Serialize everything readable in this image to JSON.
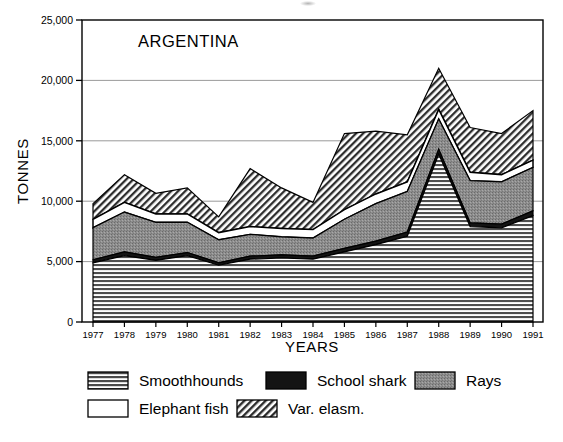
{
  "figure": {
    "panel_title": "ARGENTINA",
    "x_axis_title": "YEARS",
    "y_axis_title": "TONNES"
  },
  "legend": {
    "entries": [
      {
        "label": "Smoothhounds",
        "pattern": "horizontal-lines",
        "color": "#555555"
      },
      {
        "label": "School shark",
        "pattern": "solid-black",
        "color": "#141414"
      },
      {
        "label": "Rays",
        "pattern": "gray-stipple",
        "color": "#8a8a8a"
      },
      {
        "label": "Elephant fish",
        "pattern": "white-blank",
        "color": "#ffffff"
      },
      {
        "label": "Var. elasm.",
        "pattern": "diagonal-hatch",
        "color": "#3a3a3a"
      }
    ]
  },
  "chart_data": {
    "type": "area",
    "title": "ARGENTINA",
    "xlabel": "YEARS",
    "ylabel": "TONNES",
    "stacked": true,
    "grid": true,
    "legend_position": "bottom",
    "ylim": [
      0,
      25000
    ],
    "ytick_labels": [
      "0",
      "5,000",
      "10,000",
      "15,000",
      "20,000",
      "25,000"
    ],
    "yticks": [
      0,
      5000,
      10000,
      15000,
      20000,
      25000
    ],
    "categories": [
      1977,
      1978,
      1979,
      1980,
      1981,
      1982,
      1983,
      1984,
      1985,
      1986,
      1987,
      1988,
      1989,
      1990,
      1991
    ],
    "xtick_labels": [
      "1977",
      "1978",
      "1979",
      "1980",
      "1981",
      "1982",
      "1983",
      "1984",
      "1985",
      "1986",
      "1987",
      "1988",
      "1989",
      "1990",
      "1991"
    ],
    "series": [
      {
        "name": "Smoothhounds",
        "values": [
          4900,
          5500,
          5100,
          5500,
          4700,
          5200,
          5300,
          5200,
          5800,
          6400,
          7100,
          13900,
          7900,
          7800,
          8800
        ]
      },
      {
        "name": "School shark",
        "values": [
          250,
          300,
          250,
          250,
          200,
          250,
          250,
          250,
          300,
          300,
          350,
          400,
          300,
          300,
          400
        ]
      },
      {
        "name": "Rays",
        "values": [
          2650,
          3300,
          2900,
          2500,
          1900,
          1800,
          1500,
          1500,
          2400,
          3100,
          3350,
          2500,
          3500,
          3500,
          3600
        ]
      },
      {
        "name": "Elephant fish",
        "values": [
          700,
          800,
          700,
          700,
          600,
          650,
          700,
          700,
          800,
          800,
          800,
          800,
          700,
          600,
          600
        ]
      },
      {
        "name": "Var. elasm.",
        "values": [
          1300,
          2300,
          1700,
          2150,
          1300,
          4800,
          3350,
          2250,
          6300,
          5200,
          3900,
          3400,
          3700,
          3400,
          4100
        ]
      }
    ],
    "totals": [
      9800,
      12200,
      10650,
      11100,
      6900,
      12700,
      11100,
      9900,
      15600,
      15800,
      15500,
      21000,
      16100,
      15600,
      17500
    ]
  }
}
